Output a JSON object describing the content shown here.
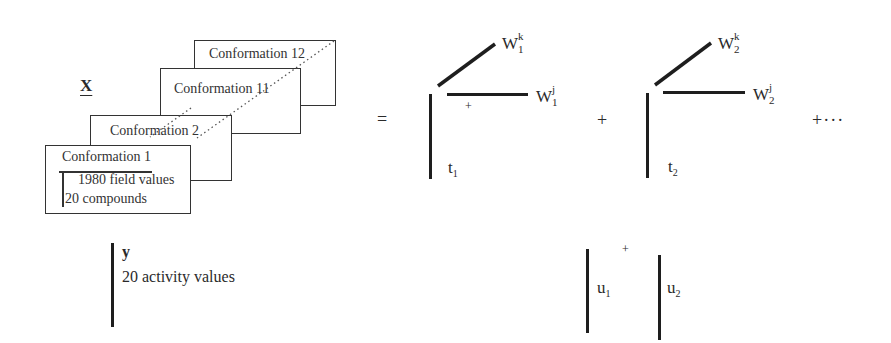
{
  "matrix_x": {
    "label": "X",
    "conformations": [
      {
        "name": "Conformation 12"
      },
      {
        "name": "Conformation 11"
      },
      {
        "name": "Conformation 2"
      },
      {
        "name": "Conformation 1"
      }
    ],
    "field_values_label": "1980 field values",
    "compounds_label": "20 compounds"
  },
  "equation": {
    "equals": "=",
    "plus_1": "+",
    "plus_ellipsis": "+···",
    "inner_plus": "+",
    "component_1": {
      "wk": "W",
      "wk_sup": "k",
      "wk_sub": "1",
      "wj": "W",
      "wj_sup": "j",
      "wj_sub": "1",
      "t": "t",
      "t_sub": "1"
    },
    "component_2": {
      "wk": "W",
      "wk_sup": "k",
      "wk_sub": "2",
      "wj": "W",
      "wj_sup": "j",
      "wj_sub": "2",
      "t": "t",
      "t_sub": "2"
    }
  },
  "vector_y": {
    "label": "y",
    "description": "20 activity values"
  },
  "u_vectors": {
    "plus": "+",
    "u1": "u",
    "u1_sub": "1",
    "u2": "u",
    "u2_sub": "2"
  }
}
